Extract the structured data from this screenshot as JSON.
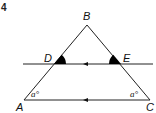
{
  "question_number": "4",
  "diagram": {
    "points": {
      "A": {
        "label": "A",
        "x": 24,
        "y": 100
      },
      "B": {
        "label": "B",
        "x": 87,
        "y": 25
      },
      "C": {
        "label": "C",
        "x": 150,
        "y": 100
      },
      "D": {
        "label": "D",
        "x": 54,
        "y": 64
      },
      "E": {
        "label": "E",
        "x": 121,
        "y": 64
      }
    },
    "angle_labels": {
      "at_A": "a°",
      "at_C": "a°"
    },
    "parallel_lines": [
      "DE",
      "AC"
    ],
    "filled_angles": [
      "D",
      "E"
    ],
    "colors": {
      "line": "#222222",
      "fill": "#000000"
    }
  }
}
